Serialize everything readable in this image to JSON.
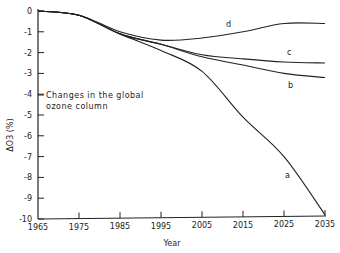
{
  "chart_data": {
    "type": "line",
    "title": "",
    "annotation": [
      "Changes in the global",
      "ozone column"
    ],
    "xlabel": "Year",
    "ylabel": "ΔO3 (%)",
    "xlim": [
      1965,
      2035
    ],
    "ylim": [
      -10,
      0
    ],
    "x_ticks": [
      "1965",
      "1975",
      "1985",
      "1995",
      "2005",
      "2015",
      "2025",
      "2035"
    ],
    "y_ticks": [
      "0",
      "-1",
      "-2",
      "-3",
      "-4",
      "-5",
      "-6",
      "-7",
      "-8",
      "-9",
      "-10"
    ],
    "grid": false,
    "legend": "inline curve labels",
    "x": [
      1965,
      1975,
      1985,
      1995,
      2005,
      2015,
      2025,
      2035
    ],
    "series": [
      {
        "name": "a",
        "values": [
          0,
          -0.2,
          -1.1,
          -1.9,
          -2.9,
          -5.1,
          -7.0,
          -9.8
        ]
      },
      {
        "name": "b",
        "values": [
          0,
          -0.2,
          -1.1,
          -1.6,
          -2.2,
          -2.6,
          -3.0,
          -3.2
        ]
      },
      {
        "name": "c",
        "values": [
          0,
          -0.2,
          -1.1,
          -1.6,
          -2.1,
          -2.3,
          -2.45,
          -2.5
        ]
      },
      {
        "name": "d",
        "values": [
          0,
          -0.2,
          -1.0,
          -1.4,
          -1.3,
          -1.0,
          -0.6,
          -0.6
        ]
      }
    ]
  }
}
